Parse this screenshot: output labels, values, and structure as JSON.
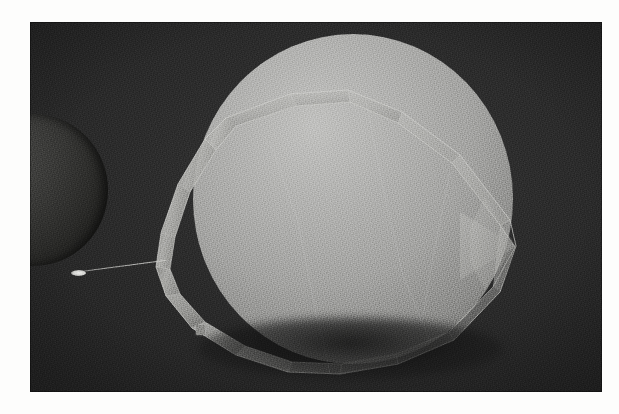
{
  "image": {
    "kind": "photograph",
    "subject": "Illuminated sphere partially encircled by a faceted polygonal band, with a smaller dark sphere at the left edge",
    "caption": "",
    "plate": {
      "background_color": "#2c2c2c",
      "border_color": "#fdfdfc",
      "border_left_px": 30,
      "border_top_px": 22,
      "content_width_px": 572,
      "content_height_px": 370,
      "grain": "heavy film grain",
      "vignette": true
    },
    "objects": [
      {
        "name": "main-sphere",
        "label": "Large illuminated sphere",
        "highlight_color": "#c2c2c0",
        "midtone_color": "#a5a5a3",
        "shadow_color": "#4a4a48",
        "center_x": 323,
        "center_y": 177,
        "diameter": 320,
        "light_direction": "upper-left"
      },
      {
        "name": "faceted-band",
        "label": "Faceted polygonal band encircling the sphere",
        "edge_color": "#d6d6d3",
        "face_color": "#b8b8b5",
        "facet_count": 14,
        "apex_point_x": 515,
        "apex_point_y": 245
      },
      {
        "name": "left-sphere",
        "label": "Small dark sphere at left edge",
        "rim_color": "#4e4e4c",
        "core_color": "#1e1e1c",
        "center_x": 3,
        "center_y": 190,
        "diameter": 150
      },
      {
        "name": "needle-probe",
        "label": "Thin needle with bright tip",
        "tip_color": "#efefec",
        "line_color": "#cfcfcc",
        "tip_x": 78,
        "tip_y": 270,
        "base_x": 137,
        "base_y": 260
      },
      {
        "name": "square-marker",
        "label": "Small bright square fiducial marker",
        "color": "#8e8e8b",
        "x": 196,
        "y": 325,
        "size": 9
      }
    ]
  }
}
